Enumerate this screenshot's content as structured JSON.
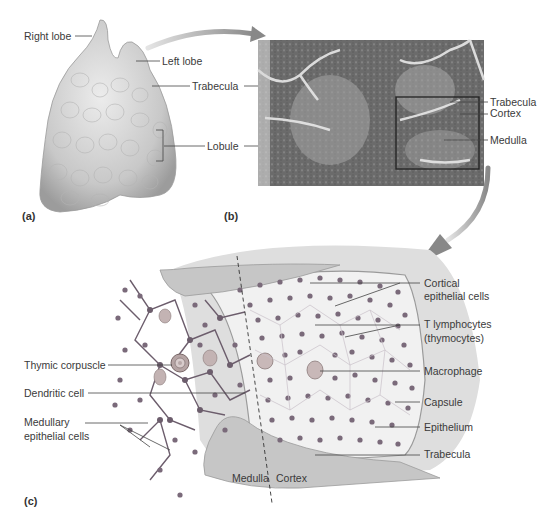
{
  "figure": {
    "panels": [
      {
        "id": "a",
        "label": "(a)"
      },
      {
        "id": "b",
        "label": "(b)"
      },
      {
        "id": "c",
        "label": "(c)"
      }
    ],
    "panel_a": {
      "labels": [
        "Right lobe",
        "Left lobe",
        "Trabecula",
        "Lobule"
      ]
    },
    "panel_b": {
      "labels": [
        "Trabecula",
        "Cortex",
        "Medulla"
      ]
    },
    "panel_c": {
      "left_labels": [
        "Thymic corpuscle",
        "Dendritic cell",
        "Medullary",
        "epithelial cells"
      ],
      "right_labels": [
        "Cortical",
        "epithelial cells",
        "T lymphocytes",
        "(thymocytes)",
        "Macrophage",
        "Capsule",
        "Epithelium",
        "Trabecula"
      ],
      "bottom_labels": [
        "Medulla",
        "Cortex"
      ]
    }
  }
}
